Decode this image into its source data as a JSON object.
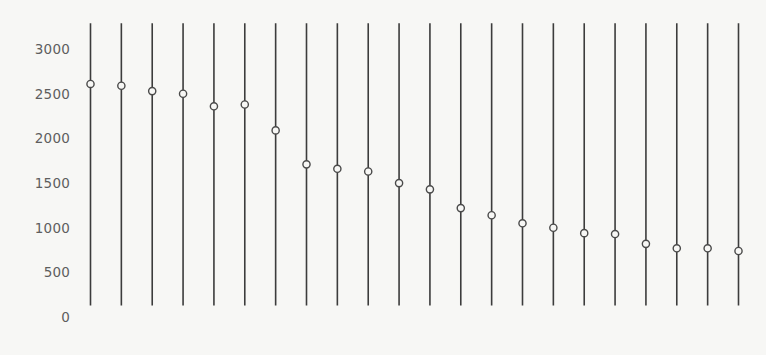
{
  "chart_data": {
    "type": "scatter",
    "title": "",
    "subtitle": "",
    "xlabel": "",
    "ylabel": "",
    "categories": [
      "1",
      "2",
      "3",
      "4",
      "5",
      "6",
      "7",
      "8",
      "9",
      "10",
      "11",
      "12",
      "13",
      "14",
      "15",
      "16",
      "17",
      "18",
      "19",
      "20",
      "21",
      "22"
    ],
    "values": [
      2620,
      2600,
      2540,
      2510,
      2370,
      2390,
      2100,
      1720,
      1670,
      1640,
      1510,
      1440,
      1230,
      1150,
      1060,
      1010,
      950,
      940,
      830,
      780,
      780,
      750
    ],
    "series": [
      {
        "name": "values",
        "values": [
          2620,
          2600,
          2540,
          2510,
          2370,
          2390,
          2100,
          1720,
          1670,
          1640,
          1510,
          1440,
          1230,
          1150,
          1060,
          1010,
          950,
          940,
          830,
          780,
          780,
          750
        ]
      }
    ],
    "ylim": [
      0,
      3100
    ],
    "yticks": [
      0,
      500,
      1000,
      1500,
      2000,
      2500,
      3000
    ],
    "ytick_labels": [
      "0",
      "500",
      "1000",
      "1500",
      "2000",
      "2500",
      "3000"
    ],
    "xlim": [
      0,
      23
    ],
    "xticks": [],
    "xtick_labels": [],
    "grid": false,
    "legend": null,
    "legend_position": "none",
    "annotations": [],
    "marker": "open-circle",
    "stem_top_value": 3300,
    "stem_bottom_value": 140,
    "colors": {
      "background": "#f7f7f5",
      "stem": "#3c3c3c",
      "marker_edge": "#4a4a4a",
      "marker_fill": "#f7f7f5",
      "tick_label": "#5e5e5e"
    }
  },
  "axes": {
    "y_axis_label_color": "#5e5e5e"
  }
}
